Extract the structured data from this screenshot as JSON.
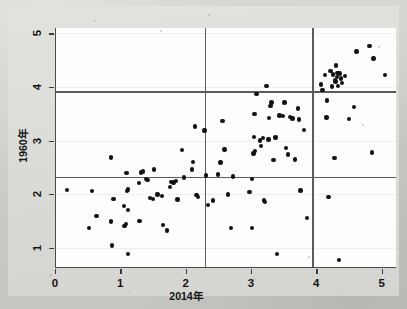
{
  "figure": {
    "type_label": "scatter-plot",
    "background_color": "#dcdcd9",
    "panel_color": "#fdfdfd",
    "point_color": "#121212",
    "reference_line_color": "#5b5b5b",
    "axis_color": "#4a4a4a"
  },
  "chart_data": {
    "type": "scatter",
    "title": "",
    "xlabel": "2014年",
    "ylabel": "1960年",
    "xlim": [
      0,
      5.22
    ],
    "ylim": [
      0.62,
      5.1
    ],
    "xticks": [
      0,
      1,
      2,
      3,
      4,
      5
    ],
    "xticklabels": [
      "0",
      "1",
      "2",
      "3",
      "4",
      "5"
    ],
    "yticks": [
      1,
      2,
      3,
      4,
      5
    ],
    "yticklabels": [
      "1",
      "2",
      "3",
      "4",
      "5"
    ],
    "grid": "horizontal-faint",
    "legend": "none",
    "reference_lines": {
      "horizontal": [
        2.32,
        3.92
      ],
      "vertical": [
        2.28,
        3.92
      ]
    },
    "points": [
      [
        0.17,
        2.08
      ],
      [
        0.5,
        1.37
      ],
      [
        0.55,
        2.06
      ],
      [
        0.62,
        1.59
      ],
      [
        0.84,
        2.68
      ],
      [
        0.84,
        1.49
      ],
      [
        0.86,
        1.04
      ],
      [
        0.88,
        1.91
      ],
      [
        1.04,
        1.78
      ],
      [
        1.05,
        1.4
      ],
      [
        1.07,
        1.44
      ],
      [
        1.08,
        2.39
      ],
      [
        1.09,
        2.06
      ],
      [
        1.1,
        2.09
      ],
      [
        1.1,
        1.7
      ],
      [
        1.1,
        0.88
      ],
      [
        1.27,
        2.21
      ],
      [
        1.28,
        1.5
      ],
      [
        1.3,
        2.4
      ],
      [
        1.33,
        2.42
      ],
      [
        1.38,
        2.28
      ],
      [
        1.4,
        2.26
      ],
      [
        1.44,
        1.93
      ],
      [
        1.48,
        1.91
      ],
      [
        1.5,
        2.46
      ],
      [
        1.55,
        1.99
      ],
      [
        1.62,
        1.97
      ],
      [
        1.64,
        1.42
      ],
      [
        1.7,
        1.32
      ],
      [
        1.74,
        2.13
      ],
      [
        1.76,
        2.23
      ],
      [
        1.8,
        2.22
      ],
      [
        1.84,
        2.25
      ],
      [
        1.86,
        1.9
      ],
      [
        1.93,
        2.82
      ],
      [
        1.96,
        2.31
      ],
      [
        2.08,
        2.46
      ],
      [
        2.1,
        2.6
      ],
      [
        2.13,
        3.26
      ],
      [
        2.15,
        1.98
      ],
      [
        2.17,
        1.95
      ],
      [
        2.27,
        3.19
      ],
      [
        2.3,
        2.35
      ],
      [
        2.33,
        1.8
      ],
      [
        2.4,
        1.88
      ],
      [
        2.48,
        2.37
      ],
      [
        2.52,
        2.59
      ],
      [
        2.55,
        3.37
      ],
      [
        2.58,
        2.83
      ],
      [
        2.63,
        1.99
      ],
      [
        2.68,
        1.37
      ],
      [
        2.71,
        2.33
      ],
      [
        2.96,
        2.04
      ],
      [
        3.0,
        2.28
      ],
      [
        3.0,
        1.37
      ],
      [
        3.02,
        2.76
      ],
      [
        3.03,
        3.07
      ],
      [
        3.04,
        3.5
      ],
      [
        3.05,
        2.8
      ],
      [
        3.07,
        3.87
      ],
      [
        3.12,
        3.0
      ],
      [
        3.14,
        2.9
      ],
      [
        3.17,
        3.05
      ],
      [
        3.18,
        1.88
      ],
      [
        3.2,
        1.85
      ],
      [
        3.22,
        4.02
      ],
      [
        3.25,
        3.02
      ],
      [
        3.26,
        3.42
      ],
      [
        3.28,
        3.64
      ],
      [
        3.3,
        3.71
      ],
      [
        3.33,
        2.64
      ],
      [
        3.36,
        3.06
      ],
      [
        3.38,
        0.88
      ],
      [
        3.42,
        3.47
      ],
      [
        3.47,
        3.46
      ],
      [
        3.5,
        3.71
      ],
      [
        3.52,
        2.86
      ],
      [
        3.55,
        2.74
      ],
      [
        3.58,
        3.44
      ],
      [
        3.62,
        3.41
      ],
      [
        3.66,
        2.65
      ],
      [
        3.7,
        3.6
      ],
      [
        3.72,
        3.39
      ],
      [
        3.74,
        2.07
      ],
      [
        3.8,
        3.2
      ],
      [
        3.84,
        1.55
      ],
      [
        4.06,
        4.05
      ],
      [
        4.08,
        3.94
      ],
      [
        4.12,
        4.22
      ],
      [
        4.14,
        3.43
      ],
      [
        4.15,
        3.75
      ],
      [
        4.17,
        1.95
      ],
      [
        4.2,
        4.3
      ],
      [
        4.22,
        4.01
      ],
      [
        4.24,
        4.23
      ],
      [
        4.26,
        2.67
      ],
      [
        4.27,
        4.13
      ],
      [
        4.28,
        4.1
      ],
      [
        4.29,
        4.4
      ],
      [
        4.3,
        4.19
      ],
      [
        4.31,
        4.26
      ],
      [
        4.32,
        4.02
      ],
      [
        4.33,
        0.77
      ],
      [
        4.34,
        4.25
      ],
      [
        4.36,
        4.16
      ],
      [
        4.38,
        4.07
      ],
      [
        4.42,
        4.2
      ],
      [
        4.48,
        3.4
      ],
      [
        4.56,
        3.63
      ],
      [
        4.6,
        4.66
      ],
      [
        4.8,
        4.76
      ],
      [
        4.84,
        2.78
      ],
      [
        4.86,
        4.53
      ],
      [
        5.04,
        4.22
      ]
    ]
  }
}
